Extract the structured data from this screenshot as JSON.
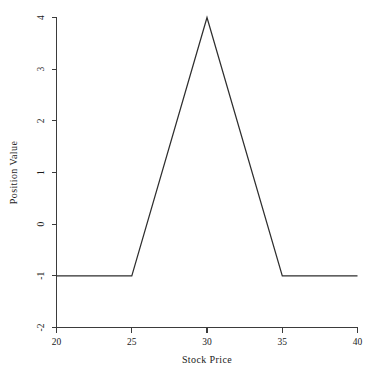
{
  "chart_data": {
    "type": "line",
    "title": "",
    "xlabel": "Stock Price",
    "ylabel": "Position Value",
    "xlim": [
      20,
      40
    ],
    "ylim": [
      -2,
      4
    ],
    "xticks": [
      20,
      25,
      30,
      35,
      40
    ],
    "yticks": [
      -2,
      -1,
      0,
      1,
      2,
      3,
      4
    ],
    "xtick_labels": [
      "20",
      "25",
      "30",
      "35",
      "40"
    ],
    "ytick_labels": [
      "-2",
      "-1",
      "0",
      "1",
      "2",
      "3",
      "4"
    ],
    "grid": false,
    "legend": false,
    "legend_position": "none",
    "tick_label_rotation_deg": 90,
    "line_color": "#2e2e2e",
    "axis_color": "#3b3b3b",
    "background_color": "#ffffff",
    "series": [
      {
        "name": "Position Value",
        "x": [
          20,
          25,
          30,
          35,
          40
        ],
        "values": [
          -1,
          -1,
          4,
          -1,
          -1
        ]
      }
    ]
  },
  "labels": {
    "x_axis_title": "Stock Price",
    "y_axis_title": "Position Value",
    "xtick_0": "20",
    "xtick_1": "25",
    "xtick_2": "30",
    "xtick_3": "35",
    "xtick_4": "40",
    "ytick_0": "-2",
    "ytick_1": "-1",
    "ytick_2": "0",
    "ytick_3": "1",
    "ytick_4": "2",
    "ytick_5": "3",
    "ytick_6": "4"
  }
}
